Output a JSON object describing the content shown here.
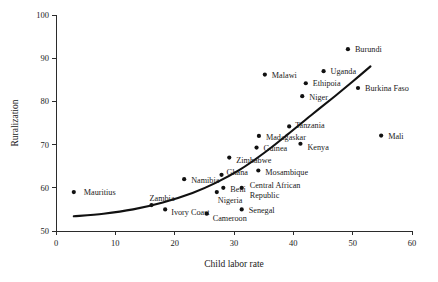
{
  "chart_data": {
    "type": "scatter",
    "title": "",
    "xlabel": "Child labor rate",
    "ylabel": "Ruralization",
    "xlim": [
      0,
      60
    ],
    "ylim": [
      50,
      100
    ],
    "xticks": [
      "0",
      "10",
      "20",
      "30",
      "40",
      "50",
      "60"
    ],
    "yticks": [
      "50",
      "60",
      "70",
      "80",
      "90",
      "100"
    ],
    "xtick_values": [
      0,
      10,
      20,
      30,
      40,
      50,
      60
    ],
    "ytick_values": [
      50,
      60,
      70,
      80,
      90,
      100
    ],
    "grid": false,
    "legend": "none",
    "marker_color": "#111111",
    "curve_color": "#111111",
    "axis_color": "#2b2b2b",
    "points": [
      {
        "label": "Mauritius",
        "x": 3.0,
        "y": 59.0,
        "lx": 10,
        "ly": 0
      },
      {
        "label": "Zambia",
        "x": 16.1,
        "y": 56.0,
        "lx": -2,
        "ly": -7
      },
      {
        "label": "Ivory Coast",
        "x": 18.4,
        "y": 55.0,
        "lx": 6,
        "ly": 3
      },
      {
        "label": "Namibia",
        "x": 21.6,
        "y": 62.0,
        "lx": 7,
        "ly": 1
      },
      {
        "label": "Cameroon",
        "x": 25.4,
        "y": 54.0,
        "lx": 6,
        "ly": 4
      },
      {
        "label": "Nigeria",
        "x": 27.1,
        "y": 59.0,
        "lx": 1,
        "ly": 8
      },
      {
        "label": "Ghana",
        "x": 27.9,
        "y": 63.0,
        "lx": 5,
        "ly": -3
      },
      {
        "label": "Beni",
        "x": 28.2,
        "y": 60.0,
        "lx": 7,
        "ly": 1
      },
      {
        "label": "Zimbabwe",
        "x": 29.2,
        "y": 67.0,
        "lx": 7,
        "ly": 2
      },
      {
        "label": "Central African",
        "x": 31.3,
        "y": 60.0,
        "lx": 8,
        "ly": -3
      },
      {
        "label": "Republic",
        "x": null,
        "y": null,
        "lx": 0,
        "ly": 0
      },
      {
        "label": "Senegal",
        "x": 31.3,
        "y": 55.0,
        "lx": 7,
        "ly": 1
      },
      {
        "label": "Guinea",
        "x": 33.8,
        "y": 69.3,
        "lx": 7,
        "ly": 0
      },
      {
        "label": "Madagaskar",
        "x": 34.2,
        "y": 72.0,
        "lx": 7,
        "ly": 1
      },
      {
        "label": "Mosambique",
        "x": 34.1,
        "y": 64.0,
        "lx": 7,
        "ly": 1
      },
      {
        "label": "Malawi",
        "x": 35.2,
        "y": 86.2,
        "lx": 7,
        "ly": 0
      },
      {
        "label": "Tanzania",
        "x": 39.3,
        "y": 74.2,
        "lx": 6,
        "ly": -1
      },
      {
        "label": "Kenya",
        "x": 41.2,
        "y": 70.2,
        "lx": 7,
        "ly": 3
      },
      {
        "label": "Niger",
        "x": 41.5,
        "y": 81.2,
        "lx": 7,
        "ly": 1
      },
      {
        "label": "Ethipoia",
        "x": 42.1,
        "y": 84.2,
        "lx": 7,
        "ly": 0
      },
      {
        "label": "Uganda",
        "x": 45.1,
        "y": 87.0,
        "lx": 7,
        "ly": 0
      },
      {
        "label": "Burundi",
        "x": 49.2,
        "y": 92.1,
        "lx": 7,
        "ly": 0
      },
      {
        "label": "Burkina Faso",
        "x": 50.9,
        "y": 83.1,
        "lx": 7,
        "ly": 0
      },
      {
        "label": "Mali",
        "x": 54.8,
        "y": 72.1,
        "lx": 7,
        "ly": 0
      }
    ],
    "trend_curve": {
      "description": "upward convex fitted curve",
      "points": [
        {
          "x": 3.0,
          "y": 53.4
        },
        {
          "x": 8.0,
          "y": 54.0
        },
        {
          "x": 13.0,
          "y": 55.0
        },
        {
          "x": 18.0,
          "y": 56.6
        },
        {
          "x": 23.0,
          "y": 58.8
        },
        {
          "x": 27.0,
          "y": 61.2
        },
        {
          "x": 31.0,
          "y": 64.2
        },
        {
          "x": 35.0,
          "y": 68.0
        },
        {
          "x": 39.0,
          "y": 72.3
        },
        {
          "x": 43.0,
          "y": 76.8
        },
        {
          "x": 47.0,
          "y": 81.2
        },
        {
          "x": 50.0,
          "y": 84.6
        },
        {
          "x": 53.0,
          "y": 88.1
        }
      ]
    }
  }
}
